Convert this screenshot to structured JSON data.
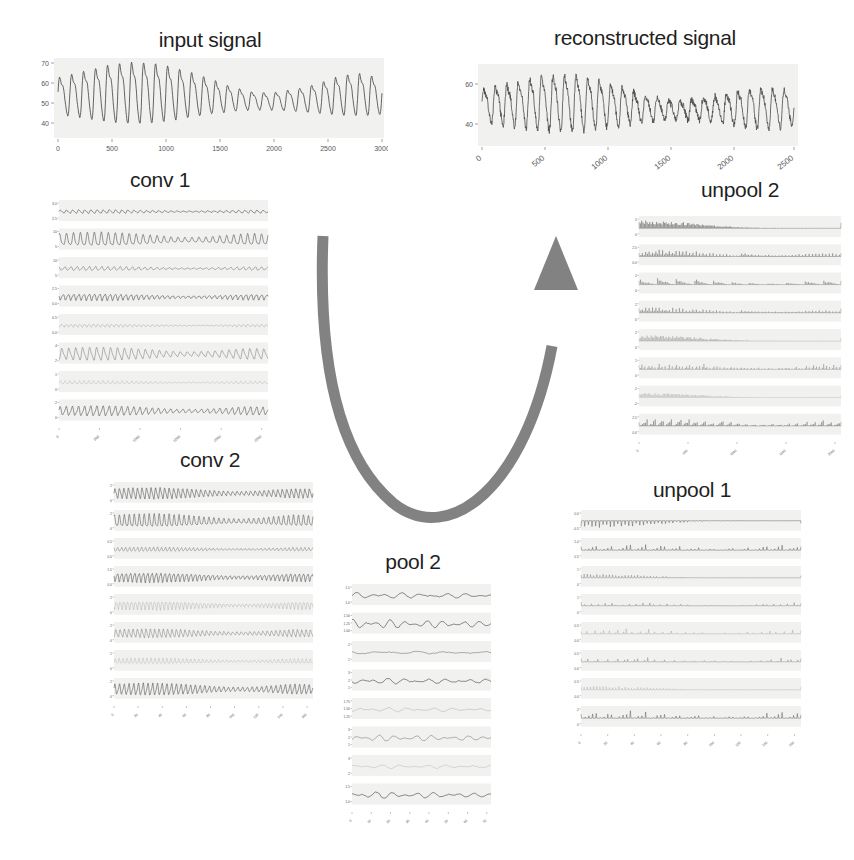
{
  "figure": {
    "background_color": "#ffffff",
    "arrow_color": "#828282",
    "trace_color": "#4a4a4a",
    "panel_bg_color": "#f1f1f0"
  },
  "panels": [
    {
      "id": "input-signal",
      "title": "input signal",
      "type": "single",
      "yticks": [
        "70",
        "60",
        "50",
        "40"
      ],
      "xticks": [
        "0",
        "500",
        "1000",
        "1500",
        "2000",
        "2500",
        "3000"
      ],
      "xticks_rotated": false
    },
    {
      "id": "reconstructed-signal",
      "title": "reconstructed signal",
      "type": "single",
      "yticks": [
        "60",
        "40"
      ],
      "xticks": [
        "0",
        "500",
        "1000",
        "1500",
        "2000",
        "2500"
      ],
      "xticks_rotated": true
    },
    {
      "id": "conv-1",
      "title": "conv 1",
      "type": "stack",
      "rows": 8,
      "xticks": [
        "0",
        "500",
        "1000",
        "1500",
        "2000",
        "2500"
      ],
      "xticks_rotated": true,
      "row_yticks": [
        [
          "3.0",
          "2.5"
        ],
        [
          "10",
          "5"
        ],
        [
          "10",
          "5"
        ],
        [
          "2.5",
          "0.0"
        ],
        [
          "0.5",
          "0.0"
        ],
        [
          "4",
          "2"
        ],
        [
          "1",
          "0"
        ],
        [
          "2",
          "0"
        ]
      ]
    },
    {
      "id": "conv-2",
      "title": "conv 2",
      "type": "stack",
      "rows": 8,
      "xticks": [
        "0",
        "20",
        "40",
        "60",
        "80",
        "100",
        "120",
        "140",
        "160"
      ],
      "xticks_rotated": true,
      "row_yticks": [
        [
          "2",
          "0"
        ],
        [
          "2",
          "0"
        ],
        [
          "0.5",
          "0.0"
        ],
        [
          "1.5",
          "0.0"
        ],
        [
          "2",
          "0"
        ],
        [
          "2",
          "0"
        ],
        [
          "1",
          "0"
        ],
        [
          "2",
          "0"
        ]
      ]
    },
    {
      "id": "pool-2",
      "title": "pool 2",
      "type": "stack",
      "rows": 8,
      "xticks": [
        "0",
        "10",
        "20",
        "30",
        "40",
        "50",
        "60",
        "70"
      ],
      "xticks_rotated": true,
      "row_yticks": [
        [
          "1.5",
          "1.0"
        ],
        [
          "1.50",
          "1.25",
          "1.00"
        ],
        [
          "2",
          "1"
        ],
        [
          "3",
          "2",
          "1"
        ],
        [
          "1.75",
          "1.50",
          "1.25"
        ],
        [
          "3",
          "2",
          "1"
        ],
        [
          "3",
          "2"
        ],
        [
          "1.5",
          "1.0"
        ]
      ]
    },
    {
      "id": "unpool-1",
      "title": "unpool 1",
      "type": "stack",
      "rows": 8,
      "xticks": [
        "0",
        "20",
        "40",
        "60",
        "80",
        "100",
        "120",
        "140",
        "160"
      ],
      "xticks_rotated": true,
      "row_yticks": [
        [
          "0.0",
          "-0.5"
        ],
        [
          "1.0",
          "0.5"
        ],
        [
          "1",
          "0"
        ],
        [
          "1",
          "0"
        ],
        [
          "0.5",
          "0.0"
        ],
        [
          "0.5",
          "0.0"
        ],
        [
          "0.5",
          "0.0"
        ],
        [
          "2",
          "0"
        ]
      ]
    },
    {
      "id": "unpool-2",
      "title": "unpool 2",
      "type": "stack",
      "rows": 8,
      "xticks": [
        "0",
        "500",
        "1000",
        "1500",
        "2000"
      ],
      "xticks_rotated": true,
      "row_yticks": [
        [
          "5",
          "0"
        ],
        [
          "2.5",
          "0.0"
        ],
        [
          "2",
          "0"
        ],
        [
          "2",
          "0"
        ],
        [
          "2",
          "0"
        ],
        [
          "1",
          "0"
        ],
        [
          "-1",
          "-2"
        ],
        [
          "2.5",
          "0.0"
        ]
      ]
    }
  ],
  "chart_data": {
    "type": "line",
    "charts": [
      {
        "name": "input signal",
        "type": "line",
        "xlabel": "",
        "ylabel": "",
        "xlim": [
          0,
          3000
        ],
        "ylim": [
          33,
          72
        ],
        "xticks": [
          0,
          500,
          1000,
          1500,
          2000,
          2500,
          3000
        ],
        "yticks": [
          40,
          50,
          60,
          70
        ],
        "series": [
          {
            "name": "input",
            "note": "quasi-periodic oscillation, ~27 cycles, amplitude growing from ~38-55 at start to ~36-68 near x=700, dipping to ~40-52 around x=1700-2100, rising again to ~38-69 at x=2500-2900"
          }
        ]
      },
      {
        "name": "reconstructed signal",
        "type": "line",
        "xlabel": "",
        "ylabel": "",
        "xlim": [
          0,
          2900
        ],
        "ylim": [
          30,
          70
        ],
        "xticks": [
          0,
          500,
          1000,
          1500,
          2000,
          2500
        ],
        "yticks": [
          40,
          60
        ],
        "series": [
          {
            "name": "reconstruction",
            "note": "noisy version of input signal, same ~27 cycle structure, amplitude ~35-65, visibly noisier trace"
          }
        ]
      },
      {
        "name": "conv 1",
        "type": "line",
        "subplots": 8,
        "xticks": [
          0,
          500,
          1000,
          1500,
          2000,
          2500
        ],
        "note": "8 feature-map channels; channels 1,3 slowly varying positive envelopes; channels 2,6,8 strongly oscillatory; channels 5,7 near-flat low amplitude"
      },
      {
        "name": "conv 2",
        "type": "line",
        "subplots": 8,
        "xticks": [
          0,
          20,
          40,
          60,
          80,
          100,
          120,
          140,
          160
        ],
        "note": "8 feature-map channels, higher frequency oscillations than conv 1, amplitudes roughly 0-2"
      },
      {
        "name": "pool 2",
        "type": "line",
        "subplots": 8,
        "xticks": [
          0,
          10,
          20,
          30,
          40,
          50,
          60,
          70
        ],
        "note": "8 pooled channels, smooth slowly-decaying curves, ~70 samples each"
      },
      {
        "name": "unpool 1",
        "type": "line",
        "subplots": 8,
        "xticks": [
          0,
          20,
          40,
          60,
          80,
          100,
          120,
          140,
          160
        ],
        "note": "8 unpooled channels, sparse spiky impulse trains from max-unpooling"
      },
      {
        "name": "unpool 2",
        "type": "line",
        "subplots": 8,
        "xticks": [
          0,
          500,
          1000,
          1500,
          2000
        ],
        "note": "8 unpooled channels at full resolution, very dense spike trains"
      }
    ]
  }
}
